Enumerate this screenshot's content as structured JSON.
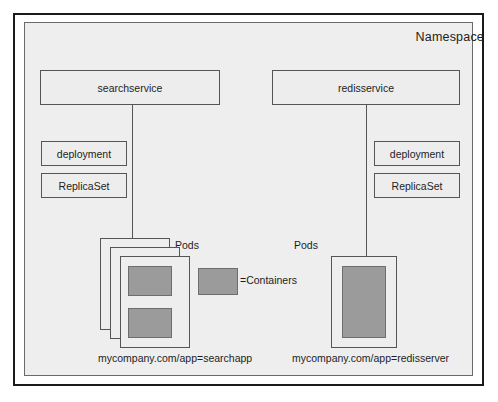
{
  "diagram": {
    "namespace_label": "Namespace",
    "colors": {
      "panel_background": "#eeeeee",
      "box_background": "#ededed",
      "container_fill": "#9b9b9b",
      "border": "#555555",
      "outer_frame": "#1a1a1a",
      "text": "#1d1d1d"
    },
    "left_stack": {
      "service": "searchservice",
      "deployment": "deployment",
      "replicaset": "ReplicaSet",
      "pods_label": "Pods",
      "selector": "mycompany.com/app=searchapp",
      "pod_card_count": 3,
      "containers_per_pod": 2
    },
    "right_stack": {
      "service": "redisservice",
      "deployment": "deployment",
      "replicaset": "ReplicaSet",
      "pods_label": "Pods",
      "selector": "mycompany.com/app=redisserver",
      "pod_card_count": 1,
      "containers_per_pod": 1
    },
    "legend": {
      "text": "=Containers"
    }
  }
}
